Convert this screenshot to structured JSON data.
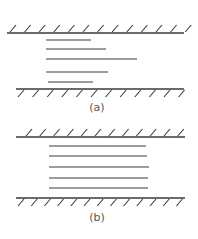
{
  "colors": {
    "stroke": "#3a3a3a",
    "label": "#555555",
    "background": "#ffffff"
  },
  "panels": [
    {
      "id": "a",
      "label": "(a)",
      "label_pos": [
        97,
        111
      ],
      "top_wall": {
        "y": 33,
        "x1": 7,
        "x2": 184,
        "hatch_side": "above",
        "hatch_start": 10,
        "hatch_count": 13,
        "hatch_step": 14.6
      },
      "bottom_wall": {
        "y": 89,
        "x1": 16,
        "x2": 184,
        "hatch_side": "below",
        "hatch_start": 18,
        "hatch_count": 12,
        "hatch_step": 14.6
      },
      "lines": [
        {
          "y": 40,
          "x1": 46,
          "x2": 91
        },
        {
          "y": 49,
          "x1": 46,
          "x2": 106
        },
        {
          "y": 59,
          "x1": 46,
          "x2": 137
        },
        {
          "y": 72,
          "x1": 46,
          "x2": 108
        },
        {
          "y": 82,
          "x1": 48,
          "x2": 93
        }
      ]
    },
    {
      "id": "b",
      "label": "(b)",
      "label_pos": [
        97,
        221
      ],
      "top_wall": {
        "y": 137,
        "x1": 16,
        "x2": 185,
        "hatch_side": "above",
        "hatch_start": 26,
        "hatch_count": 12,
        "hatch_step": 13.8
      },
      "bottom_wall": {
        "y": 198,
        "x1": 16,
        "x2": 185,
        "hatch_side": "below",
        "hatch_start": 18,
        "hatch_count": 13,
        "hatch_step": 13.2
      },
      "lines": [
        {
          "y": 146,
          "x1": 49,
          "x2": 146
        },
        {
          "y": 156,
          "x1": 49,
          "x2": 147
        },
        {
          "y": 167,
          "x1": 49,
          "x2": 149
        },
        {
          "y": 178,
          "x1": 49,
          "x2": 148
        },
        {
          "y": 188,
          "x1": 49,
          "x2": 148
        }
      ]
    }
  ]
}
